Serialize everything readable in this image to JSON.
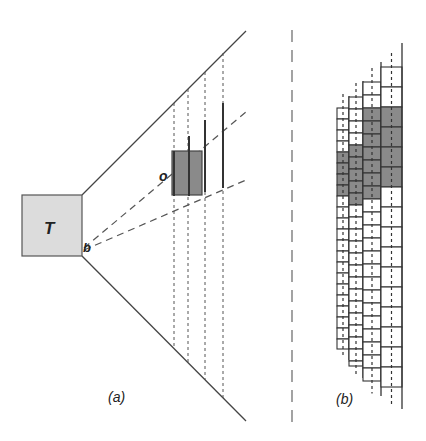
{
  "panel_a": {
    "caption": "(a)",
    "box_label": "T",
    "corner_label": "b",
    "object_label": "o",
    "colors": {
      "box_fill": "#dcdcdc",
      "object_fill": "#8a8a8a",
      "line": "#444444"
    }
  },
  "panel_b": {
    "caption": "(b)",
    "colors": {
      "cell_fill": "#ffffff",
      "shaded_fill": "#8a8a8a",
      "line": "#333333"
    },
    "columns": [
      {
        "x": 337,
        "w": 12,
        "top": 108,
        "bottom": 360,
        "row_h": 11,
        "shaded": [
          148,
          196
        ]
      },
      {
        "x": 349,
        "w": 14,
        "top": 97,
        "bottom": 378,
        "row_h": 12,
        "shaded": [
          143,
          200
        ]
      },
      {
        "x": 363,
        "w": 18,
        "top": 82,
        "bottom": 396,
        "row_h": 13,
        "shaded": [
          111,
          200
        ]
      },
      {
        "x": 381,
        "w": 21,
        "top": 67,
        "bottom": 409,
        "row_h": 20,
        "shaded": [
          98,
          183
        ]
      }
    ]
  }
}
